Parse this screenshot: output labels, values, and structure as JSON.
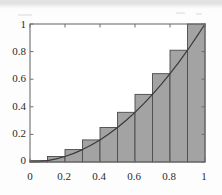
{
  "figure": {
    "kind": "riemann-sum-plot",
    "caption": "",
    "background_color": "#fdfdfd",
    "frame_color": "#6e6e6e",
    "bar_fill_color": "#a3a3a3",
    "bar_edge_color": "#4a4a4a",
    "curve_color": "#3a3a3a",
    "tick_color": "#6e6e6e",
    "label_color": "#2b2b2b"
  },
  "chart_data": {
    "type": "bar",
    "title": "",
    "subtitle": "",
    "xlabel": "",
    "ylabel": "",
    "xlim": [
      0,
      1
    ],
    "ylim": [
      0,
      1
    ],
    "grid": false,
    "legend": false,
    "legend_position": "none",
    "xticks": [
      0,
      0.2,
      0.4,
      0.6,
      0.8,
      1
    ],
    "xticklabels": [
      "0",
      "0.2",
      "0.4",
      "0.6",
      "0.8",
      "1"
    ],
    "yticks": [
      0,
      0.2,
      0.4,
      0.6,
      0.8,
      1
    ],
    "yticklabels": [
      "0",
      "0.2",
      "0.4",
      "0.6",
      "0.8",
      "1"
    ],
    "bar_width": 0.1,
    "bar_align": "right-endpoint",
    "categories": [
      "0.0-0.1",
      "0.1-0.2",
      "0.2-0.3",
      "0.3-0.4",
      "0.4-0.5",
      "0.5-0.6",
      "0.6-0.7",
      "0.7-0.8",
      "0.8-0.9",
      "0.9-1.0"
    ],
    "bar_left_edges": [
      0,
      0.1,
      0.2,
      0.3,
      0.4,
      0.5,
      0.6,
      0.7,
      0.8,
      0.9
    ],
    "bar_right_edges": [
      0.1,
      0.2,
      0.3,
      0.4,
      0.5,
      0.6,
      0.7,
      0.8,
      0.9,
      1.0
    ],
    "values": [
      0.01,
      0.04,
      0.09,
      0.16,
      0.25,
      0.36,
      0.49,
      0.64,
      0.81,
      1.0
    ],
    "series": [
      {
        "name": "upper sum rectangles",
        "type": "bar",
        "values": [
          0.01,
          0.04,
          0.09,
          0.16,
          0.25,
          0.36,
          0.49,
          0.64,
          0.81,
          1.0
        ]
      },
      {
        "name": "y = x^2",
        "type": "line",
        "x": [
          0,
          0.05,
          0.1,
          0.15,
          0.2,
          0.25,
          0.3,
          0.35,
          0.4,
          0.45,
          0.5,
          0.55,
          0.6,
          0.65,
          0.7,
          0.75,
          0.8,
          0.85,
          0.9,
          0.95,
          1.0
        ],
        "values": [
          0,
          0.0025,
          0.01,
          0.0225,
          0.04,
          0.0625,
          0.09,
          0.1225,
          0.16,
          0.2025,
          0.25,
          0.3025,
          0.36,
          0.4225,
          0.49,
          0.5625,
          0.64,
          0.7225,
          0.81,
          0.9025,
          1.0
        ]
      }
    ],
    "annotations": []
  }
}
